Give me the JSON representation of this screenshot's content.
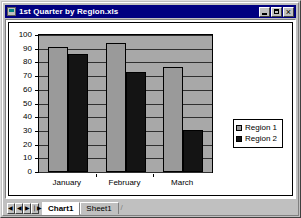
{
  "window": {
    "title": "1st Quarter by Region.xls",
    "icon": "excel-workbook-icon",
    "controls": {
      "minimize": "Minimize",
      "maximize": "Maximize",
      "close": "Close"
    }
  },
  "colors": {
    "titlebar": "#000080",
    "window_face": "#c0c0c0",
    "chart_area": "#ffffff",
    "plot_area": "#a8a8a8",
    "series_1": "#9a9a9a",
    "series_2": "#141414",
    "axis": "#000000",
    "gridline": "#303030"
  },
  "chart_data": {
    "type": "bar",
    "title": "",
    "xlabel": "",
    "ylabel": "",
    "categories": [
      "January",
      "February",
      "March"
    ],
    "series": [
      {
        "name": "Region 1",
        "color": "#9a9a9a",
        "values": [
          91,
          94,
          77
        ]
      },
      {
        "name": "Region 2",
        "color": "#141414",
        "values": [
          86,
          73,
          31
        ]
      }
    ],
    "ylim": [
      0,
      100
    ],
    "yticks": [
      0,
      10,
      20,
      30,
      40,
      50,
      60,
      70,
      80,
      90,
      100
    ],
    "ytick_labels": [
      "0",
      "10",
      "20",
      "30",
      "40",
      "50",
      "60",
      "70",
      "80",
      "90",
      "100"
    ],
    "grid": true,
    "legend_position": "right"
  },
  "tab_bar": {
    "nav": [
      {
        "name": "first-sheet",
        "glyph": "◀❘"
      },
      {
        "name": "prev-sheet",
        "glyph": "◀"
      },
      {
        "name": "next-sheet",
        "glyph": "▶"
      },
      {
        "name": "last-sheet",
        "glyph": "❘▶"
      }
    ],
    "tabs": [
      {
        "label": "Chart1",
        "active": true
      },
      {
        "label": "Sheet1",
        "active": false
      }
    ]
  }
}
